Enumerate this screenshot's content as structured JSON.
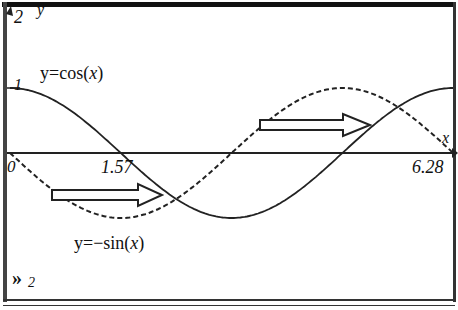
{
  "chart_data": {
    "type": "line",
    "title": "",
    "xlabel": "x",
    "ylabel": "y",
    "xlim": [
      0,
      6.28
    ],
    "ylim": [
      -2,
      2
    ],
    "x_tick_labels": [
      "0",
      "1.57",
      "6.28"
    ],
    "y_tick_labels": [
      "1",
      "2"
    ],
    "grid": false,
    "series": [
      {
        "name": "y=cos(x)",
        "style": "solid",
        "function": "cos(x)",
        "x": [
          0,
          1.57,
          3.14,
          4.71,
          6.28
        ],
        "values": [
          1,
          0,
          -1,
          0,
          1
        ]
      },
      {
        "name": "y=-sin(x)",
        "style": "dashed",
        "function": "-sin(x)",
        "x": [
          0,
          1.57,
          3.14,
          4.71,
          6.28
        ],
        "values": [
          0,
          -1,
          0,
          1,
          0
        ]
      }
    ],
    "annotations": [
      {
        "type": "arrow",
        "from_x": 0.6,
        "to_x": 2.36,
        "y": -0.7,
        "note": "horizontal shift from -sin to cos"
      },
      {
        "type": "arrow",
        "from_x": 3.6,
        "to_x": 5.5,
        "y": 0.45,
        "note": "horizontal shift from -sin to cos"
      }
    ]
  },
  "labels": {
    "y_axis": "y",
    "x_axis": "x",
    "y_top": "2",
    "y_one": "1",
    "x_zero": "0",
    "x_half_pi": "1.57",
    "x_two_pi": "6.28",
    "cos_prefix": "y=cos(",
    "cos_var": "x",
    "cos_suffix": ")",
    "sin_prefix": "y=−sin(",
    "sin_var": "x",
    "sin_suffix": ")",
    "entry_line": "2"
  }
}
